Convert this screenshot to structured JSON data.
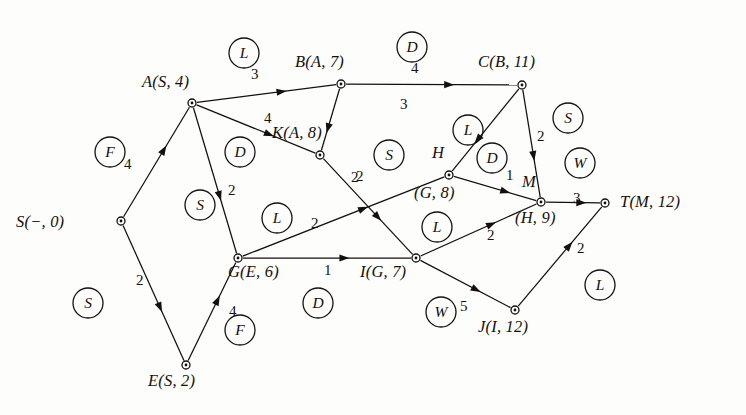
{
  "figure": {
    "background_color": "#fdfdfc",
    "ink_color": "#14100d",
    "width": 746,
    "height": 415
  },
  "nodes": [
    {
      "id": "S",
      "label_html": "S(−, 0)",
      "x": 121,
      "y": 221,
      "label_x": 16,
      "label_y": 212,
      "anchor": "left"
    },
    {
      "id": "A",
      "label_html": "A(S, 4)",
      "x": 192,
      "y": 103,
      "label_x": 142,
      "label_y": 72,
      "anchor": "left"
    },
    {
      "id": "B",
      "label_html": "B(A, 7)",
      "x": 341,
      "y": 84,
      "label_x": 295,
      "label_y": 52,
      "anchor": "left"
    },
    {
      "id": "C",
      "label_html": "C(B, 11)",
      "x": 522,
      "y": 85,
      "label_x": 478,
      "label_y": 52,
      "anchor": "left"
    },
    {
      "id": "K",
      "label_html": "K(A, 8)",
      "x": 320,
      "y": 155,
      "label_x": 272,
      "label_y": 123,
      "anchor": "left"
    },
    {
      "id": "H",
      "label_html": "H",
      "x": 449,
      "y": 175,
      "label_x": 432,
      "label_y": 143,
      "anchor": "left"
    },
    {
      "id": "H2",
      "label_html": "(G, 8)",
      "x": 449,
      "y": 175,
      "label_x": 414,
      "label_y": 183,
      "anchor": "left"
    },
    {
      "id": "M",
      "label_html": "M",
      "x": 541,
      "y": 202,
      "label_x": 522,
      "label_y": 172,
      "anchor": "left"
    },
    {
      "id": "M2",
      "label_html": "(H, 9)",
      "x": 541,
      "y": 202,
      "label_x": 515,
      "label_y": 208,
      "anchor": "left"
    },
    {
      "id": "T",
      "label_html": "T(M, 12)",
      "x": 605,
      "y": 203,
      "label_x": 620,
      "label_y": 192,
      "anchor": "left"
    },
    {
      "id": "G",
      "label_html": "G(E, 6)",
      "x": 238,
      "y": 258,
      "label_x": 228,
      "label_y": 262,
      "anchor": "left"
    },
    {
      "id": "I",
      "label_html": "I(G, 7)",
      "x": 416,
      "y": 258,
      "label_x": 360,
      "label_y": 262,
      "anchor": "left"
    },
    {
      "id": "J",
      "label_html": "J(I, 12)",
      "x": 515,
      "y": 310,
      "label_x": 478,
      "label_y": 317,
      "anchor": "left"
    },
    {
      "id": "E",
      "label_html": "E(S, 2)",
      "x": 186,
      "y": 365,
      "label_x": 148,
      "label_y": 371,
      "anchor": "left"
    }
  ],
  "edges": [
    {
      "from": "S",
      "to": "A",
      "weight": "4",
      "weight_x": 124,
      "weight_y": 156
    },
    {
      "from": "S",
      "to": "E",
      "weight": "2",
      "weight_x": 136,
      "weight_y": 272
    },
    {
      "from": "E",
      "to": "G",
      "weight": "4",
      "weight_x": 229,
      "weight_y": 303
    },
    {
      "from": "A",
      "to": "B",
      "weight": "3",
      "weight_x": 251,
      "weight_y": 66
    },
    {
      "from": "A",
      "to": "K",
      "weight": "4",
      "weight_x": 264,
      "weight_y": 110
    },
    {
      "from": "A",
      "to": "G",
      "weight": "2",
      "weight_x": 228,
      "weight_y": 182
    },
    {
      "from": "B",
      "to": "C",
      "weight": "4",
      "weight_x": 411,
      "weight_y": 60
    },
    {
      "from": "B",
      "to": "K",
      "weight": "2",
      "weight_x": 351,
      "weight_y": 169
    },
    {
      "from": "C",
      "to": "H",
      "weight": "3",
      "weight_x": 400,
      "weight_y": 96
    },
    {
      "from": "C",
      "to": "M",
      "weight": "2",
      "weight_x": 537,
      "weight_y": 128
    },
    {
      "from": "K",
      "to": "I",
      "weight": "2",
      "weight_x": 356,
      "weight_y": 168
    },
    {
      "from": "G",
      "to": "H",
      "weight": "2",
      "weight_x": 311,
      "weight_y": 215
    },
    {
      "from": "G",
      "to": "I",
      "weight": "1",
      "weight_x": 324,
      "weight_y": 262
    },
    {
      "from": "H",
      "to": "M",
      "weight": "1",
      "weight_x": 506,
      "weight_y": 167
    },
    {
      "from": "I",
      "to": "M",
      "weight": "2",
      "weight_x": 487,
      "weight_y": 227
    },
    {
      "from": "I",
      "to": "J",
      "weight": "5",
      "weight_x": 460,
      "weight_y": 298
    },
    {
      "from": "J",
      "to": "T",
      "weight": "2",
      "weight_x": 577,
      "weight_y": 240
    },
    {
      "from": "M",
      "to": "T",
      "weight": "3",
      "weight_x": 573,
      "weight_y": 190
    }
  ],
  "markers": [
    {
      "letter": "L",
      "x": 244,
      "y": 53,
      "r": 15
    },
    {
      "letter": "D",
      "x": 412,
      "y": 47,
      "r": 15
    },
    {
      "letter": "S",
      "x": 568,
      "y": 118,
      "r": 15
    },
    {
      "letter": "F",
      "x": 110,
      "y": 152,
      "r": 15
    },
    {
      "letter": "D",
      "x": 240,
      "y": 152,
      "r": 15
    },
    {
      "letter": "L",
      "x": 468,
      "y": 130,
      "r": 15
    },
    {
      "letter": "S",
      "x": 389,
      "y": 155,
      "r": 15
    },
    {
      "letter": "D",
      "x": 492,
      "y": 158,
      "r": 15
    },
    {
      "letter": "W",
      "x": 580,
      "y": 163,
      "r": 15
    },
    {
      "letter": "S",
      "x": 200,
      "y": 205,
      "r": 15
    },
    {
      "letter": "L",
      "x": 277,
      "y": 218,
      "r": 15
    },
    {
      "letter": "L",
      "x": 437,
      "y": 227,
      "r": 15
    },
    {
      "letter": "S",
      "x": 88,
      "y": 303,
      "r": 15
    },
    {
      "letter": "D",
      "x": 318,
      "y": 303,
      "r": 15
    },
    {
      "letter": "W",
      "x": 441,
      "y": 312,
      "r": 15
    },
    {
      "letter": "L",
      "x": 600,
      "y": 285,
      "r": 15
    },
    {
      "letter": "F",
      "x": 240,
      "y": 330,
      "r": 15
    }
  ],
  "chart_data": {
    "type": "diagram",
    "vertices": [
      "S",
      "A",
      "B",
      "C",
      "K",
      "H",
      "M",
      "T",
      "G",
      "I",
      "J",
      "E"
    ],
    "vertex_labels": {
      "S": "S(-, 0)",
      "A": "A(S, 4)",
      "B": "B(A, 7)",
      "C": "C(B, 11)",
      "K": "K(A, 8)",
      "H": "H(G, 8)",
      "M": "M(H, 9)",
      "T": "T(M, 12)",
      "G": "G(E, 6)",
      "I": "I(G, 7)",
      "J": "J(I, 12)",
      "E": "E(S, 2)"
    },
    "edges": [
      [
        "S",
        "A",
        4
      ],
      [
        "S",
        "E",
        2
      ],
      [
        "E",
        "G",
        4
      ],
      [
        "A",
        "B",
        3
      ],
      [
        "A",
        "K",
        4
      ],
      [
        "A",
        "G",
        2
      ],
      [
        "B",
        "C",
        4
      ],
      [
        "B",
        "K",
        2
      ],
      [
        "C",
        "H",
        3
      ],
      [
        "C",
        "M",
        2
      ],
      [
        "K",
        "I",
        2
      ],
      [
        "G",
        "H",
        2
      ],
      [
        "G",
        "I",
        1
      ],
      [
        "H",
        "M",
        1
      ],
      [
        "I",
        "M",
        2
      ],
      [
        "I",
        "J",
        5
      ],
      [
        "J",
        "T",
        2
      ],
      [
        "M",
        "T",
        3
      ]
    ],
    "marker_letters": [
      "L",
      "D",
      "S",
      "F",
      "D",
      "L",
      "S",
      "D",
      "W",
      "S",
      "L",
      "L",
      "S",
      "D",
      "W",
      "L",
      "F"
    ]
  }
}
